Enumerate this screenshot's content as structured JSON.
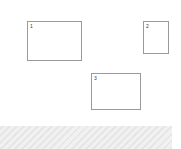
{
  "canvas": {
    "width": 181,
    "height": 149,
    "background_color": "#ffffff"
  },
  "regions": [
    {
      "label": "1",
      "x": 27,
      "y": 21,
      "width": 55,
      "height": 40,
      "border_color": "#9a9a9a",
      "fill_color": "#ffffff"
    },
    {
      "label": "2",
      "x": 143,
      "y": 21,
      "width": 26,
      "height": 33,
      "border_color": "#9a9a9a",
      "fill_color": "#ffffff"
    },
    {
      "label": "3",
      "x": 91,
      "y": 73,
      "width": 50,
      "height": 37,
      "border_color": "#9a9a9a",
      "fill_color": "#ffffff"
    }
  ],
  "footer_band": {
    "x": 0,
    "y": 126,
    "width": 172,
    "height": 23,
    "base_color": "#ececed",
    "stripe_color": "#e6e6e7"
  }
}
